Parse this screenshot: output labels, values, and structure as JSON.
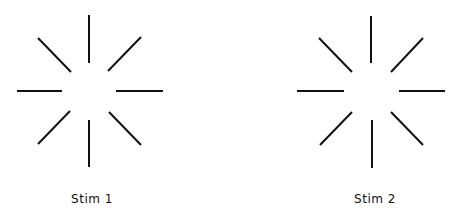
{
  "figure": {
    "background": "#ffffff",
    "line_color": "#111111",
    "stimuli": [
      {
        "label": "Stim 1",
        "label_x": 92,
        "lines": [
          {
            "id": "top",
            "x1": 89,
            "y1": 15,
            "x2": 89,
            "y2": 63
          },
          {
            "id": "upper-right",
            "x1": 108,
            "y1": 71,
            "x2": 141,
            "y2": 37
          },
          {
            "id": "right",
            "x1": 116,
            "y1": 91,
            "x2": 163,
            "y2": 91
          },
          {
            "id": "lower-right",
            "x1": 109,
            "y1": 112,
            "x2": 141,
            "y2": 145
          },
          {
            "id": "bottom",
            "x1": 89,
            "y1": 120,
            "x2": 89,
            "y2": 167
          },
          {
            "id": "lower-left",
            "x1": 70,
            "y1": 111,
            "x2": 38,
            "y2": 144
          },
          {
            "id": "left",
            "x1": 17,
            "y1": 91,
            "x2": 62,
            "y2": 91
          },
          {
            "id": "upper-left",
            "x1": 38,
            "y1": 38,
            "x2": 71,
            "y2": 72
          }
        ]
      },
      {
        "label": "Stim 2",
        "label_x": 375,
        "lines": [
          {
            "id": "top",
            "x1": 371,
            "y1": 16,
            "x2": 371,
            "y2": 63
          },
          {
            "id": "upper-right",
            "x1": 391,
            "y1": 72,
            "x2": 423,
            "y2": 38
          },
          {
            "id": "right",
            "x1": 399,
            "y1": 91,
            "x2": 445,
            "y2": 91
          },
          {
            "id": "lower-right",
            "x1": 391,
            "y1": 112,
            "x2": 423,
            "y2": 145
          },
          {
            "id": "bottom",
            "x1": 372,
            "y1": 120,
            "x2": 372,
            "y2": 168
          },
          {
            "id": "lower-left",
            "x1": 352,
            "y1": 112,
            "x2": 320,
            "y2": 145
          },
          {
            "id": "left",
            "x1": 297,
            "y1": 91,
            "x2": 344,
            "y2": 91
          },
          {
            "id": "upper-left",
            "x1": 319,
            "y1": 38,
            "x2": 352,
            "y2": 72
          }
        ]
      }
    ]
  }
}
